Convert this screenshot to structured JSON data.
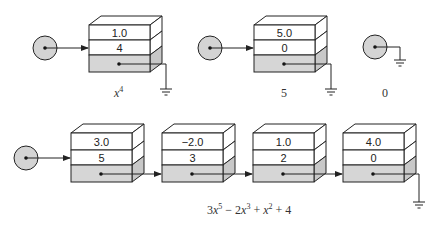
{
  "colors": {
    "stroke": "#222222",
    "shaded": "#d6d6d6",
    "side_shaded": "#c8c8c8",
    "face": "#ffffff",
    "head_fill": "#d4d4d4"
  },
  "top_row": {
    "lists": [
      {
        "label": "x^4",
        "label_base": "x",
        "label_exp": "4",
        "nodes": [
          {
            "coef": "1.0",
            "exp": "4",
            "next": "null"
          }
        ]
      },
      {
        "label": "5",
        "nodes": [
          {
            "coef": "5.0",
            "exp": "0",
            "next": "null"
          }
        ]
      },
      {
        "label": "0",
        "nodes": []
      }
    ]
  },
  "bottom_row": {
    "label": "3x^5 − 2x^3 + x^2 + 4",
    "label_parts": {
      "t1_coef": "3",
      "t1_var": "x",
      "t1_exp": "5",
      "op1": " − ",
      "t2_coef": "2",
      "t2_var": "x",
      "t2_exp": "3",
      "op2": " + ",
      "t3_var": "x",
      "t3_exp": "2",
      "op3": " + ",
      "t4": "4"
    },
    "nodes": [
      {
        "coef": "3.0",
        "exp": "5"
      },
      {
        "coef": "−2.0",
        "exp": "3"
      },
      {
        "coef": "1.0",
        "exp": "2"
      },
      {
        "coef": "4.0",
        "exp": "0",
        "next": "null"
      }
    ]
  }
}
